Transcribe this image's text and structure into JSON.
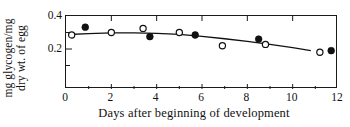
{
  "chart_data": {
    "type": "scatter",
    "title": "",
    "xlabel": "Days after beginning of development",
    "ylabel": "mg glycogen/mg dry wt. of egg",
    "ylabel_line1": "mg glycogen/mg",
    "ylabel_line2": "dry wt. of egg",
    "xlim": [
      0,
      12
    ],
    "ylim": [
      0.0,
      0.4
    ],
    "grid": false,
    "legend": "none",
    "x_ticks_major": [
      0,
      2,
      4,
      6,
      8,
      10,
      12
    ],
    "x_ticks_major_labels": [
      "0",
      "2",
      "4",
      "6",
      "8",
      "10",
      "12"
    ],
    "x_ticks_minor": [
      1,
      3,
      5,
      7,
      9,
      11
    ],
    "y_ticks_major": [
      0.2,
      0.4
    ],
    "y_ticks_major_labels": [
      "0.2",
      "0.4"
    ],
    "y_ticks_minor": [
      0.1,
      0.3
    ],
    "series": [
      {
        "name": "open-circles",
        "marker": "open-circle",
        "color": "#111111",
        "points": [
          {
            "x": 0.25,
            "y": 0.285
          },
          {
            "x": 2.0,
            "y": 0.3
          },
          {
            "x": 3.4,
            "y": 0.325
          },
          {
            "x": 5.0,
            "y": 0.3
          },
          {
            "x": 6.9,
            "y": 0.22
          },
          {
            "x": 8.8,
            "y": 0.228
          },
          {
            "x": 11.2,
            "y": 0.18
          }
        ]
      },
      {
        "name": "filled-circles",
        "marker": "filled-circle",
        "color": "#111111",
        "points": [
          {
            "x": 0.85,
            "y": 0.332
          },
          {
            "x": 3.7,
            "y": 0.275
          },
          {
            "x": 5.7,
            "y": 0.285
          },
          {
            "x": 8.5,
            "y": 0.26
          },
          {
            "x": 11.7,
            "y": 0.19
          }
        ]
      },
      {
        "name": "fitted-curve",
        "marker": "none",
        "color": "#111111",
        "points": [
          {
            "x": 0.1,
            "y": 0.288
          },
          {
            "x": 1.0,
            "y": 0.293
          },
          {
            "x": 2.0,
            "y": 0.298
          },
          {
            "x": 3.0,
            "y": 0.298
          },
          {
            "x": 4.0,
            "y": 0.295
          },
          {
            "x": 5.0,
            "y": 0.289
          },
          {
            "x": 6.0,
            "y": 0.277
          },
          {
            "x": 7.0,
            "y": 0.262
          },
          {
            "x": 8.0,
            "y": 0.246
          },
          {
            "x": 9.0,
            "y": 0.228
          },
          {
            "x": 10.0,
            "y": 0.208
          },
          {
            "x": 10.8,
            "y": 0.19
          }
        ]
      }
    ]
  }
}
